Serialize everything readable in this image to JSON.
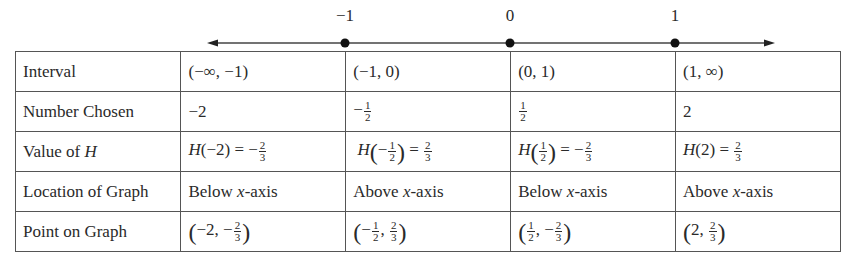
{
  "number_line": {
    "ticks": [
      {
        "label": "−1",
        "x": 345
      },
      {
        "label": "0",
        "x": 510
      },
      {
        "label": "1",
        "x": 675
      }
    ]
  },
  "table": {
    "rows": [
      {
        "header": "Interval",
        "cells": [
          "(−∞, −1)",
          "(−1, 0)",
          "(0, 1)",
          "(1, ∞)"
        ]
      },
      {
        "header": "Number Chosen",
        "cells": [
          {
            "sign": "−",
            "value": "2"
          },
          {
            "sign": "−",
            "num": "1",
            "den": "2"
          },
          {
            "sign": "",
            "num": "1",
            "den": "2"
          },
          {
            "sign": "",
            "value": "2"
          }
        ]
      },
      {
        "header_prefix": "Value of ",
        "header_var": "H",
        "cells": [
          {
            "fn": "H",
            "arg": "(−2)",
            "eq": " = −",
            "num": "2",
            "den": "3"
          },
          {
            "fn": "H",
            "arg_sign": "−",
            "arg_num": "1",
            "arg_den": "2",
            "eq": " = ",
            "num": "2",
            "den": "3"
          },
          {
            "fn": "H",
            "arg_sign": "",
            "arg_num": "1",
            "arg_den": "2",
            "eq": " = −",
            "num": "2",
            "den": "3"
          },
          {
            "fn": "H",
            "arg": "(2)",
            "eq": " = ",
            "num": "2",
            "den": "3"
          }
        ]
      },
      {
        "header": "Location of Graph",
        "cells": [
          {
            "pre": "Below ",
            "var": "x",
            "post": "-axis"
          },
          {
            "pre": "Above ",
            "var": "x",
            "post": "-axis"
          },
          {
            "pre": "Below ",
            "var": "x",
            "post": "-axis"
          },
          {
            "pre": "Above ",
            "var": "x",
            "post": "-axis"
          }
        ]
      },
      {
        "header": "Point on Graph",
        "cells": [
          {
            "x_sign": "−",
            "x": "2",
            "y_sign": "−",
            "y_num": "2",
            "y_den": "3"
          },
          {
            "x_sign": "−",
            "x_num": "1",
            "x_den": "2",
            "y_sign": "",
            "y_num": "2",
            "y_den": "3"
          },
          {
            "x_sign": "",
            "x_num": "1",
            "x_den": "2",
            "y_sign": "−",
            "y_num": "2",
            "y_den": "3"
          },
          {
            "x_sign": "",
            "x": "2",
            "y_sign": "",
            "y_num": "2",
            "y_den": "3"
          }
        ]
      }
    ]
  }
}
